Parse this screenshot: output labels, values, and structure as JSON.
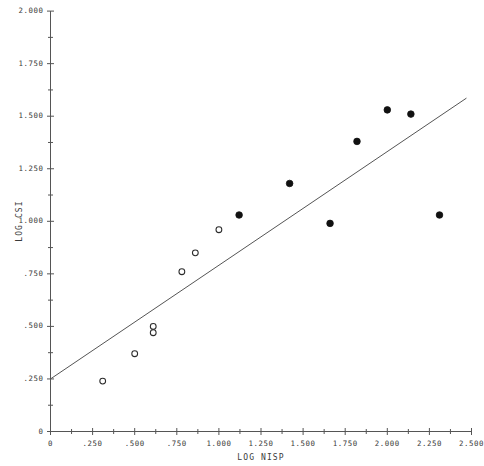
{
  "figure": {
    "background_color": "#ffffff",
    "ink_color": "#2b2b2b",
    "width": 478,
    "height": 466
  },
  "chart_data": {
    "type": "scatter",
    "title": "",
    "subtitle": "",
    "xlabel": "LOG NISP",
    "ylabel": "LOG CSI",
    "xlim": [
      0,
      2.5
    ],
    "ylim": [
      0,
      2.0
    ],
    "grid": false,
    "legend": null,
    "x_ticks": [
      0,
      0.25,
      0.5,
      0.75,
      1.0,
      1.25,
      1.5,
      1.75,
      2.0,
      2.25,
      2.5
    ],
    "x_tick_labels": [
      "0",
      ".250",
      ".500",
      ".750",
      "1.000",
      "1.250",
      "1.500",
      "1.750",
      "2.000",
      "2.250",
      "2.500"
    ],
    "x_minor_ticks": [
      0.125,
      0.375,
      0.625,
      0.875,
      1.125,
      1.375,
      1.625,
      1.875,
      2.125,
      2.375
    ],
    "y_ticks": [
      0,
      0.25,
      0.5,
      0.75,
      1.0,
      1.25,
      1.5,
      1.75,
      2.0
    ],
    "y_tick_labels": [
      "0",
      ".250",
      ".500",
      ".750",
      "1.000",
      "1.250",
      "1.500",
      "1.750",
      "2.000"
    ],
    "y_minor_ticks": [
      0.125,
      0.375,
      0.625,
      0.875,
      1.125,
      1.375,
      1.625,
      1.875
    ],
    "series": [
      {
        "name": "open-marker-group",
        "marker": "open-circle",
        "marker_color": "#2b2b2b",
        "marker_fill": "none",
        "points": [
          {
            "x": 0.31,
            "y": 0.24
          },
          {
            "x": 0.5,
            "y": 0.37
          },
          {
            "x": 0.61,
            "y": 0.5
          },
          {
            "x": 0.61,
            "y": 0.47
          },
          {
            "x": 0.78,
            "y": 0.76
          },
          {
            "x": 0.86,
            "y": 0.85
          },
          {
            "x": 1.0,
            "y": 0.96
          }
        ]
      },
      {
        "name": "filled-marker-group",
        "marker": "filled-circle",
        "marker_color": "#111111",
        "marker_fill": "#111111",
        "points": [
          {
            "x": 1.12,
            "y": 1.03
          },
          {
            "x": 1.42,
            "y": 1.18
          },
          {
            "x": 1.66,
            "y": 0.99
          },
          {
            "x": 1.82,
            "y": 1.38
          },
          {
            "x": 2.0,
            "y": 1.53
          },
          {
            "x": 2.14,
            "y": 1.51
          },
          {
            "x": 2.31,
            "y": 1.03
          }
        ]
      }
    ],
    "fit_line": {
      "name": "regression-line",
      "x0": 0.0,
      "y0": 0.25,
      "x1": 2.47,
      "y1": 1.586,
      "color": "#555555"
    }
  }
}
